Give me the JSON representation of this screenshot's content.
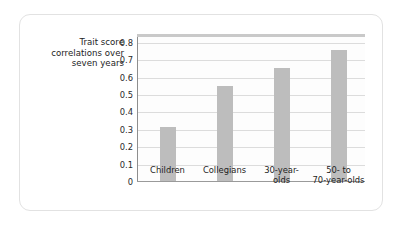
{
  "figure": {
    "y_axis_caption_lines": [
      "Trait score",
      "correlations over",
      "seven years"
    ],
    "bar_color": "#bdbdbd",
    "gridline_color": "#dcdcdc",
    "axis_color": "#8e8e8e",
    "card_border_color": "#e2e2e2"
  },
  "chart_data": {
    "type": "bar",
    "title": "",
    "xlabel": "",
    "ylabel": "Trait score correlations over seven years",
    "categories": [
      "Children",
      "Collegians",
      "30-year-olds",
      "50- to 70-year-olds"
    ],
    "category_label_lines": [
      [
        "Children"
      ],
      [
        "Collegians"
      ],
      [
        "30-year-",
        "olds"
      ],
      [
        "50- to",
        "70-year-olds"
      ]
    ],
    "values": [
      0.31,
      0.545,
      0.65,
      0.75
    ],
    "ylim": [
      0,
      0.85
    ],
    "yticks": [
      0,
      0.1,
      0.2,
      0.3,
      0.4,
      0.5,
      0.6,
      0.7,
      0.8
    ],
    "ytick_labels": [
      "0",
      "0.1",
      "0.2",
      "0.3",
      "0.4",
      "0.5",
      "0.6",
      "0.7",
      "0.8"
    ],
    "grid": true,
    "legend": "none",
    "legend_position": "none"
  }
}
